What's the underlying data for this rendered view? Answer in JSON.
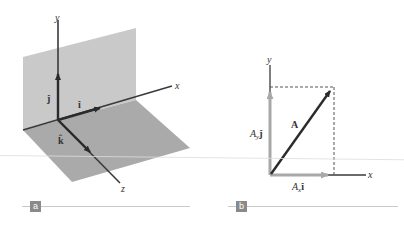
{
  "figure": {
    "panels": [
      {
        "id": "a",
        "badge": "a",
        "axes": {
          "x": "x",
          "y": "y",
          "z": "z"
        },
        "unit_vectors": {
          "i": "î",
          "j": "ĵ",
          "k": "k̂"
        }
      },
      {
        "id": "b",
        "badge": "b",
        "axes": {
          "x": "x",
          "y": "y"
        },
        "vector_label": "A⃗",
        "x_component": {
          "coef": "A",
          "sub": "x",
          "unit": "î"
        },
        "y_component": {
          "coef": "A",
          "sub": "y",
          "unit": "ĵ"
        }
      }
    ],
    "colors": {
      "axis": "#3a3a3a",
      "plane_vertical": "#c4c4c4",
      "plane_horizontal": "#a9a9a9",
      "component_arrow": "#a8a8a8",
      "vector_arrow": "#2b2b2b",
      "badge": "#8a8a8a"
    }
  }
}
